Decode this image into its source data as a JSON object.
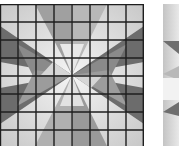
{
  "figure": {
    "type": "quilt-star-pattern",
    "panels": [
      {
        "id": "grid-star",
        "grid": {
          "rows": 8,
          "cols": 8,
          "line_color": "#1e1e1e"
        },
        "colors": {
          "light": "#e6e6e6",
          "mid": "#a6a6a6",
          "dark": "#6c6c6c",
          "bg_shade": "#d0d0d0"
        }
      },
      {
        "id": "plain-star-partial",
        "grid": null,
        "colors": {
          "light": "#ececec",
          "mid": "#b4b4b4",
          "dark": "#6e6e6e"
        }
      }
    ]
  }
}
